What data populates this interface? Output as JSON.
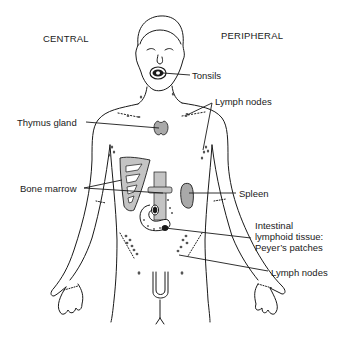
{
  "diagram": {
    "headers": {
      "left": "CENTRAL",
      "right": "PERIPHERAL"
    },
    "labels": {
      "tonsils": "Tonsils",
      "lymph_nodes_upper": "Lymph nodes",
      "thymus": "Thymus gland",
      "bone_marrow": "Bone marrow",
      "spleen": "Spleen",
      "intestinal_1": "Intestinal",
      "intestinal_2": "lymphoid tissue:",
      "intestinal_3": "Peyer’s patches",
      "lymph_nodes_lower": "Lymph nodes"
    },
    "colors": {
      "outline": "#1a1a1a",
      "organ_fill": "#a9a9a9",
      "marrow_fill": "#c4c4c4",
      "node_fill": "#555555"
    }
  }
}
